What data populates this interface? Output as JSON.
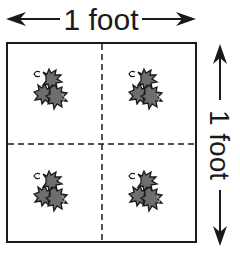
{
  "top_dimension": {
    "label": "1 foot"
  },
  "right_dimension": {
    "label": "1 foot"
  },
  "grid": {
    "rows": 2,
    "columns": 2,
    "divider_style": "dashed"
  },
  "plants": [
    {
      "name": "holly-plant",
      "row": 1,
      "col": 1
    },
    {
      "name": "holly-plant",
      "row": 1,
      "col": 2
    },
    {
      "name": "holly-plant",
      "row": 2,
      "col": 1
    },
    {
      "name": "holly-plant",
      "row": 2,
      "col": 2
    }
  ],
  "colors": {
    "line": "#1a1a1a",
    "leaf": "#6e6e6e",
    "leaf_highlight": "#bdbdbd"
  }
}
